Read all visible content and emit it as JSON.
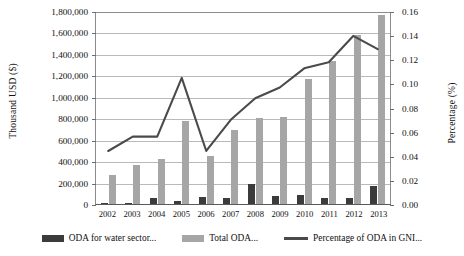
{
  "chart_data": {
    "type": "bar",
    "title": "",
    "categories": [
      "2002",
      "2003",
      "2004",
      "2005",
      "2006",
      "2007",
      "2008",
      "2009",
      "2010",
      "2011",
      "2012",
      "2013"
    ],
    "xlabel": "",
    "ylabel": "Thousand USD ($)",
    "ylabel_secondary": "Percentage (%)",
    "ylim": [
      0,
      1800000
    ],
    "ylim_secondary": [
      0,
      0.16
    ],
    "grid": true,
    "legend_position": "bottom",
    "yticks": [
      "0",
      "200,000",
      "400,000",
      "600,000",
      "800,000",
      "1,000,000",
      "1,200,000",
      "1,400,000",
      "1,600,000",
      "1,800,000"
    ],
    "ytick_values": [
      0,
      200000,
      400000,
      600000,
      800000,
      1000000,
      1200000,
      1400000,
      1600000,
      1800000
    ],
    "yticks_secondary": [
      "0.00",
      "0.02",
      "0.04",
      "0.06",
      "0.08",
      "0.10",
      "0.12",
      "0.14",
      "0.16"
    ],
    "ytick_values_secondary": [
      0,
      0.02,
      0.04,
      0.06,
      0.08,
      0.1,
      0.12,
      0.14,
      0.16
    ],
    "series": [
      {
        "name": "ODA for water sector...",
        "type": "bar",
        "axis": "left",
        "color": "#3b3b3b",
        "values": [
          5000,
          5000,
          60000,
          25000,
          65000,
          60000,
          190000,
          75000,
          80000,
          55000,
          60000,
          165000
        ]
      },
      {
        "name": "Total ODA...",
        "type": "bar",
        "axis": "left",
        "color": "#a6a6a6",
        "values": [
          270000,
          360000,
          420000,
          770000,
          450000,
          690000,
          800000,
          810000,
          1170000,
          1330000,
          1580000,
          1760000
        ]
      },
      {
        "name": "Percentage of ODA in GNI...",
        "type": "line",
        "axis": "right",
        "color": "#4a4a4a",
        "values": [
          0.044,
          0.056,
          0.056,
          0.105,
          0.044,
          0.07,
          0.088,
          0.097,
          0.113,
          0.118,
          0.14,
          0.129
        ]
      }
    ]
  }
}
